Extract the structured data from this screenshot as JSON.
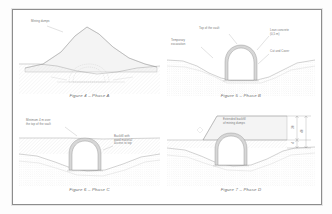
{
  "document": {
    "type": "technical-drawing-sheet",
    "figure_count": 4
  },
  "figures": [
    {
      "id": "figure-4",
      "caption": "Figure 4 – Phase A",
      "labels": [
        {
          "name": "mining-dumps-label",
          "text": "Mining dumps"
        }
      ]
    },
    {
      "id": "figure-5",
      "caption": "Figure 5 – Phase B",
      "labels": [
        {
          "name": "top-of-vault-label",
          "text": "Top of the vault"
        },
        {
          "name": "temporary-excavation-label",
          "text": "Temporary\nexcavation"
        },
        {
          "name": "lean-concrete-label",
          "text": "Lean concrete\n(0,5 m)"
        },
        {
          "name": "cut-and-cover-label",
          "text": "Cut and Cover"
        }
      ]
    },
    {
      "id": "figure-6",
      "caption": "Figure 6 – Phase C",
      "labels": [
        {
          "name": "minimum-cover-label",
          "text": "Minimum 4 m over\nthe top of the vault"
        },
        {
          "name": "backfill-label",
          "text": "Backfill with\ngood material\naccess to top"
        }
      ]
    },
    {
      "id": "figure-7",
      "caption": "Figure 7 – Phase D",
      "labels": [
        {
          "name": "extended-backfill-label",
          "text": "Extended backfill\nof mining dumps"
        }
      ],
      "dimensions": [
        {
          "name": "dimension-inner",
          "value": "30"
        },
        {
          "name": "dimension-outer",
          "value": "40"
        },
        {
          "name": "dimension-lower",
          "value": "4"
        }
      ]
    }
  ],
  "colors": {
    "sheet_border": "#8d8d8d",
    "line": "#8f8f8f",
    "ground_fill": "#efefef",
    "vault_fill": "#d7d7d7",
    "text": "#7a7a7a"
  }
}
